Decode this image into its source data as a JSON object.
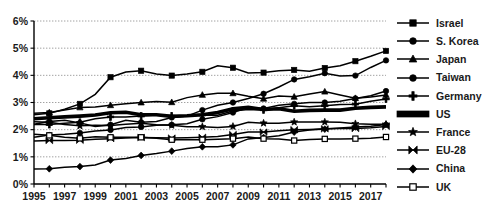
{
  "chart_data": {
    "type": "line",
    "title": "",
    "xlabel": "",
    "ylabel": "",
    "grid": true,
    "legend_position": "right",
    "xlim": [
      1995,
      2018
    ],
    "ylim": [
      0,
      6
    ],
    "y_tick_labels": [
      "0%",
      "1%",
      "2%",
      "3%",
      "4%",
      "5%",
      "6%"
    ],
    "y_tick_values": [
      0,
      1,
      2,
      3,
      4,
      5,
      6
    ],
    "x_tick_labels": [
      "1995",
      "1997",
      "1999",
      "2001",
      "2003",
      "2005",
      "2007",
      "2009",
      "2011",
      "2013",
      "2015",
      "2017"
    ],
    "x_tick_values": [
      1995,
      1997,
      1999,
      2001,
      2003,
      2005,
      2007,
      2009,
      2011,
      2013,
      2015,
      2017
    ],
    "x": [
      1995,
      1996,
      1997,
      1998,
      1999,
      2000,
      2001,
      2002,
      2003,
      2004,
      2005,
      2006,
      2007,
      2008,
      2009,
      2010,
      2011,
      2012,
      2013,
      2014,
      2015,
      2016,
      2017,
      2018
    ],
    "series": [
      {
        "name": "Israel",
        "marker": "square",
        "values": [
          2.55,
          2.6,
          2.75,
          2.95,
          3.3,
          3.93,
          4.12,
          4.17,
          4.05,
          3.99,
          4.05,
          4.13,
          4.35,
          4.28,
          4.09,
          4.1,
          4.17,
          4.2,
          4.15,
          4.27,
          4.35,
          4.52,
          4.7,
          4.9
        ]
      },
      {
        "name": "S. Korea",
        "marker": "circle",
        "values": [
          2.2,
          2.3,
          2.35,
          2.25,
          2.12,
          2.18,
          2.35,
          2.27,
          2.3,
          2.45,
          2.5,
          2.72,
          2.9,
          3.0,
          3.15,
          3.32,
          3.57,
          3.85,
          3.95,
          4.08,
          3.98,
          3.99,
          4.29,
          4.55
        ]
      },
      {
        "name": "Japan",
        "marker": "triangle",
        "values": [
          2.6,
          2.63,
          2.72,
          2.82,
          2.83,
          2.9,
          2.95,
          3.0,
          3.04,
          3.01,
          3.18,
          3.28,
          3.34,
          3.34,
          3.23,
          3.14,
          3.24,
          3.21,
          3.31,
          3.4,
          3.28,
          3.16,
          3.2,
          3.28
        ]
      },
      {
        "name": "Taiwan",
        "marker": "circle",
        "values": [
          1.72,
          1.8,
          1.83,
          1.88,
          1.95,
          1.99,
          2.08,
          2.1,
          2.16,
          2.18,
          2.22,
          2.38,
          2.48,
          2.63,
          2.82,
          2.78,
          2.9,
          2.95,
          3.0,
          3.0,
          3.05,
          3.15,
          3.25,
          3.42
        ]
      },
      {
        "name": "Germany",
        "marker": "plus",
        "values": [
          2.19,
          2.19,
          2.24,
          2.27,
          2.4,
          2.47,
          2.47,
          2.5,
          2.54,
          2.5,
          2.51,
          2.54,
          2.53,
          2.69,
          2.74,
          2.73,
          2.81,
          2.88,
          2.84,
          2.88,
          2.93,
          2.94,
          3.05,
          3.13
        ]
      },
      {
        "name": "US",
        "marker": "bar",
        "values": [
          2.4,
          2.44,
          2.47,
          2.5,
          2.54,
          2.62,
          2.64,
          2.55,
          2.55,
          2.49,
          2.51,
          2.55,
          2.63,
          2.77,
          2.82,
          2.74,
          2.77,
          2.68,
          2.71,
          2.72,
          2.72,
          2.79,
          2.82,
          2.84
        ]
      },
      {
        "name": "France",
        "marker": "star",
        "values": [
          2.29,
          2.27,
          2.19,
          2.14,
          2.16,
          2.15,
          2.2,
          2.24,
          2.18,
          2.16,
          2.11,
          2.11,
          2.08,
          2.12,
          2.27,
          2.24,
          2.24,
          2.28,
          2.28,
          2.28,
          2.27,
          2.22,
          2.2,
          2.2
        ]
      },
      {
        "name": "EU-28",
        "marker": "bowtie",
        "values": [
          1.58,
          1.6,
          1.6,
          1.61,
          1.65,
          1.67,
          1.69,
          1.71,
          1.7,
          1.69,
          1.7,
          1.72,
          1.75,
          1.82,
          1.91,
          1.91,
          1.96,
          2.0,
          2.01,
          2.03,
          2.04,
          2.04,
          2.07,
          2.12
        ]
      },
      {
        "name": "China",
        "marker": "diamond",
        "values": [
          0.55,
          0.56,
          0.62,
          0.64,
          0.7,
          0.88,
          0.94,
          1.05,
          1.12,
          1.21,
          1.31,
          1.37,
          1.37,
          1.44,
          1.66,
          1.71,
          1.78,
          1.91,
          1.99,
          2.02,
          2.06,
          2.1,
          2.13,
          2.19
        ]
      },
      {
        "name": "UK",
        "marker": "square-hollow",
        "values": [
          1.83,
          1.79,
          1.72,
          1.68,
          1.74,
          1.72,
          1.72,
          1.72,
          1.68,
          1.63,
          1.63,
          1.63,
          1.65,
          1.67,
          1.73,
          1.67,
          1.66,
          1.6,
          1.64,
          1.66,
          1.66,
          1.67,
          1.68,
          1.73
        ]
      }
    ]
  },
  "legend": {
    "items": [
      {
        "label": "Israel",
        "key": "legend-key-israel"
      },
      {
        "label": "S. Korea",
        "key": "legend-key-s-korea"
      },
      {
        "label": "Japan",
        "key": "legend-key-japan"
      },
      {
        "label": "Taiwan",
        "key": "legend-key-taiwan"
      },
      {
        "label": "Germany",
        "key": "legend-key-germany"
      },
      {
        "label": "US",
        "key": "legend-key-us"
      },
      {
        "label": "France",
        "key": "legend-key-france"
      },
      {
        "label": "EU-28",
        "key": "legend-key-eu-28"
      },
      {
        "label": "China",
        "key": "legend-key-china"
      },
      {
        "label": "UK",
        "key": "legend-key-uk"
      }
    ]
  },
  "colors": {
    "series": "#000000",
    "grid": "#8a8a8a",
    "axis": "#000000",
    "text": "#1a1a1a",
    "background": "#ffffff"
  }
}
